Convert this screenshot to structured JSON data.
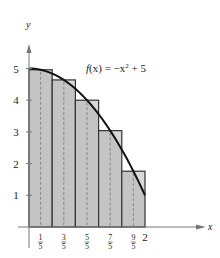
{
  "chart_data": {
    "type": "bar",
    "title": "",
    "xlabel": "x",
    "ylabel": "y",
    "function_label": "f(x) = −x² + 5",
    "function_label_parts": {
      "prefix": "f",
      "arg": "(x) = −x",
      "exp": "2",
      "suffix": " + 5"
    },
    "xlim": [
      0,
      2.2
    ],
    "ylim": [
      0,
      5.5
    ],
    "grid": false,
    "legend": "none",
    "method": "midpoint Riemann sum",
    "categories": [
      "1/5",
      "3/5",
      "5/5",
      "7/5",
      "9/5"
    ],
    "midpoints": [
      0.2,
      0.6,
      1.0,
      1.4,
      1.8
    ],
    "rect_left_edges": [
      0.0,
      0.4,
      0.8,
      1.2,
      1.6
    ],
    "rect_width": 0.4,
    "values": [
      4.96,
      4.64,
      4.0,
      3.04,
      1.76
    ],
    "curve": {
      "x": [
        0,
        0.4,
        0.8,
        1.2,
        1.6,
        2.0
      ],
      "y": [
        5,
        4.84,
        4.36,
        3.56,
        2.44,
        1.0
      ]
    },
    "x_ticks": [
      {
        "num": "1",
        "den": "5",
        "value": 0.2
      },
      {
        "num": "3",
        "den": "5",
        "value": 0.6
      },
      {
        "num": "5",
        "den": "5",
        "value": 1.0
      },
      {
        "num": "7",
        "den": "5",
        "value": 1.4
      },
      {
        "num": "9",
        "den": "5",
        "value": 1.8
      }
    ],
    "x_end_label": "2",
    "y_ticks": [
      "1",
      "2",
      "3",
      "4",
      "5"
    ]
  },
  "colors": {
    "rect_fill": "#c4c4c4",
    "rect_overhang_fill": "#d9d9d9",
    "rect_stroke": "#333333",
    "curve": "#111111",
    "axis": "#777777",
    "dashed": "#777777"
  }
}
